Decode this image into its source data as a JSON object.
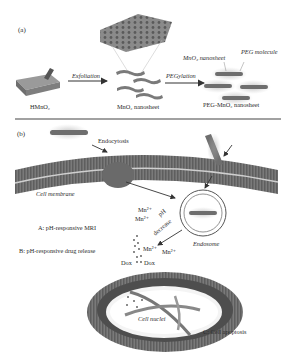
{
  "panel_a": {
    "label": "(a)",
    "steps": [
      {
        "name": "HMnO₂"
      },
      {
        "name": "MnO₂ nanosheet"
      },
      {
        "name": "PEG-MnO₂ nanosheet"
      }
    ],
    "arrows": {
      "exfoliation": "Exfoliation",
      "pegylation": "PEGylation"
    },
    "callouts": {
      "mno2_nanosheet": "MnO₂ nanosheet",
      "peg_molecule": "PEG molecule"
    }
  },
  "panel_b": {
    "label": "(b)",
    "endocytosis": "Endocytosis",
    "cell_membrane": "Cell membrane",
    "endosome": "Endosome",
    "ph_decrease_line1": "pH",
    "ph_decrease_line2": "decrease",
    "ions": [
      "Mn²⁺",
      "Mn²⁺",
      "Mn²⁺",
      "Mn²⁺"
    ],
    "dox": [
      "Dox",
      "Dox"
    ],
    "label_a": "A: pH-responsive MRI",
    "label_b": "B: pH-responsive drug release",
    "cell_nuclei": "Cell nuclei",
    "label_c": "C: Cell apoptosis"
  },
  "colors": {
    "membrane": "#6e6e6e",
    "membrane_light": "#bdbdbd",
    "sheet": "#7a7a7a",
    "arrow": "#333333",
    "divider": "#444444"
  }
}
